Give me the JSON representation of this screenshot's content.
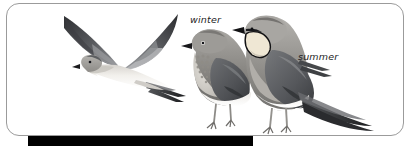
{
  "plate": {
    "kind": "bird-identification-plate",
    "subject": "pratincole",
    "frame": {
      "border_color": "#9b9b9b",
      "background_color": "#ffffff",
      "corner_radius_px": 13
    },
    "bottom_bar": {
      "color": "#000000",
      "left_px": 28,
      "width_px": 225
    }
  },
  "labels": {
    "winter": "winter",
    "summer": "summer"
  },
  "figures": [
    {
      "id": "flying-bird",
      "name": "pratincole-in-flight",
      "pose": "flight",
      "description": "bird in flight with long pointed wings raised in a shallow V, pale belly, dark upperwings and forked tail",
      "plumage_tones": {
        "upperwing": "#54565a",
        "wing_tip": "#2b2c30",
        "underbody": "#f2f0ec",
        "head": "#b9b7b3"
      }
    },
    {
      "id": "winter-bird",
      "name": "pratincole-winter-plumage",
      "pose": "standing",
      "label": "winter",
      "description": "standing bird with scaled speckled throat and breast, no black throat border, grey-brown upperparts, white belly",
      "plumage_tones": {
        "mantle": "#7e7d7b",
        "wing": "#56575a",
        "breast": "#cfcbc4",
        "belly": "#f6f4f1"
      }
    },
    {
      "id": "summer-bird",
      "name": "pratincole-summer-plumage",
      "pose": "standing",
      "label": "summer",
      "description": "standing bird with cream throat patch outlined by a thin black border, black bill, grey-brown upperparts, long forked tail streamers",
      "plumage_tones": {
        "mantle": "#8a8885",
        "wing": "#5e5f62",
        "throat_patch": "#efe7d4",
        "throat_border": "#111111",
        "bill": "#141414",
        "belly": "#f6f4f1"
      }
    }
  ],
  "colors": {
    "ink": "#1d1d1d",
    "frame_border": "#9b9b9b",
    "bar": "#000000",
    "paper": "#ffffff"
  }
}
